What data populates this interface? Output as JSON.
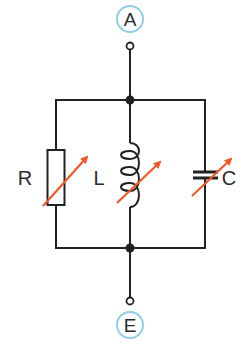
{
  "diagram": {
    "type": "circuit-schematic",
    "colors": {
      "wire": "#222222",
      "arrow": "#f05a28",
      "terminal_ring": "#8fd0e8",
      "background": "#ffffff"
    },
    "terminals": [
      {
        "id": "A",
        "label": "A",
        "position": "top"
      },
      {
        "id": "E",
        "label": "E",
        "position": "bottom"
      }
    ],
    "components": [
      {
        "id": "R",
        "label": "R",
        "kind": "variable-resistor"
      },
      {
        "id": "L",
        "label": "L",
        "kind": "variable-inductor"
      },
      {
        "id": "C",
        "label": "C",
        "kind": "variable-capacitor"
      }
    ],
    "connection": "parallel"
  }
}
